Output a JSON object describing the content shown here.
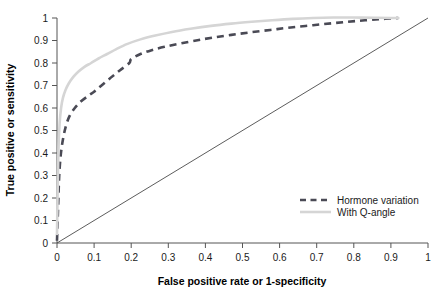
{
  "chart_data": {
    "type": "line",
    "title": "",
    "xlabel": "False positive rate or 1-specificity",
    "ylabel": "True positive or sensitivity",
    "xlim": [
      0,
      1
    ],
    "ylim": [
      0,
      1
    ],
    "grid": false,
    "legend_position": "bottom-right",
    "x_ticks": [
      "0",
      "0.1",
      "0.2",
      "0.3",
      "0.4",
      "0.5",
      "0.6",
      "0.7",
      "0.8",
      "0.9",
      "1"
    ],
    "y_ticks": [
      "0",
      "0.1",
      "0.2",
      "0.3",
      "0.4",
      "0.5",
      "0.6",
      "0.7",
      "0.8",
      "0.9",
      "1"
    ],
    "x_tick_values": [
      0,
      0.1,
      0.2,
      0.3,
      0.4,
      0.5,
      0.6,
      0.7,
      0.8,
      0.9,
      1
    ],
    "y_tick_values": [
      0,
      0.1,
      0.2,
      0.3,
      0.4,
      0.5,
      0.6,
      0.7,
      0.8,
      0.9,
      1
    ],
    "series": [
      {
        "name": "Hormone variation",
        "style": "dashed",
        "color": "#4a4a55",
        "x": [
          0.0,
          0.002,
          0.004,
          0.006,
          0.01,
          0.016,
          0.024,
          0.034,
          0.048,
          0.065,
          0.085,
          0.1,
          0.12,
          0.145,
          0.17,
          0.195,
          0.2,
          0.225,
          0.255,
          0.29,
          0.33,
          0.375,
          0.42,
          0.47,
          0.52,
          0.575,
          0.63,
          0.69,
          0.75,
          0.81,
          0.87,
          0.92
        ],
        "y": [
          0.01,
          0.11,
          0.21,
          0.3,
          0.39,
          0.46,
          0.52,
          0.565,
          0.6,
          0.63,
          0.655,
          0.672,
          0.7,
          0.735,
          0.768,
          0.8,
          0.818,
          0.84,
          0.857,
          0.872,
          0.886,
          0.9,
          0.913,
          0.925,
          0.936,
          0.947,
          0.958,
          0.968,
          0.978,
          0.987,
          0.995,
          1.0
        ]
      },
      {
        "name": "With Q-angle",
        "style": "solid",
        "color": "#d5d5d5",
        "x": [
          0.0,
          0.002,
          0.004,
          0.007,
          0.011,
          0.016,
          0.023,
          0.032,
          0.044,
          0.058,
          0.074,
          0.092,
          0.112,
          0.135,
          0.16,
          0.19,
          0.225,
          0.265,
          0.31,
          0.36,
          0.415,
          0.47,
          0.525,
          0.58,
          0.635,
          0.69,
          0.745,
          0.8,
          0.855,
          0.9,
          0.92
        ],
        "y": [
          0.04,
          0.26,
          0.42,
          0.53,
          0.6,
          0.645,
          0.68,
          0.71,
          0.738,
          0.762,
          0.783,
          0.8,
          0.82,
          0.84,
          0.862,
          0.885,
          0.905,
          0.922,
          0.938,
          0.952,
          0.965,
          0.975,
          0.983,
          0.99,
          0.996,
          1.0,
          1.002,
          1.002,
          1.001,
          1.0,
          1.0
        ]
      },
      {
        "name": "reference-diagonal",
        "style": "solid-thin",
        "color": "#4a4a4a",
        "x": [
          0,
          1
        ],
        "y": [
          0,
          1
        ]
      }
    ],
    "annotations": []
  },
  "legend": {
    "items": [
      {
        "label": "Hormone variation",
        "style": "dashed",
        "color": "#4a4a55"
      },
      {
        "label": "With Q-angle",
        "style": "solid",
        "color": "#d5d5d5"
      }
    ]
  },
  "axes": {
    "x_title": "False positive rate or 1-specificity",
    "y_title": "True positive or sensitivity"
  }
}
